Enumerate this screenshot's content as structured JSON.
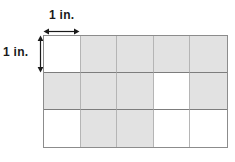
{
  "figure": {
    "width_label": "1 in.",
    "height_label": "1 in."
  },
  "colors": {
    "shaded_cell": "#e2e2e2",
    "unshaded_cell": "#ffffff",
    "column_line": "#b5b5b5",
    "row_line": "#7d7d7d",
    "outer_border": "#8c8c8c",
    "arrow": "#1a1a1a",
    "label_text": "#1a1a1a",
    "background": "#ffffff"
  },
  "chart_data": {
    "type": "heatmap",
    "columns": 5,
    "rows": 3,
    "unit_width": "1 in.",
    "unit_height": "1 in.",
    "total_cells": 15,
    "shaded_count": 9,
    "unshaded_count": 6,
    "legend": [
      "shaded",
      "unshaded"
    ],
    "grid": [
      [
        "unshaded",
        "shaded",
        "shaded",
        "shaded",
        "shaded"
      ],
      [
        "shaded",
        "shaded",
        "shaded",
        "unshaded",
        "shaded"
      ],
      [
        "unshaded",
        "shaded",
        "shaded",
        "unshaded",
        "unshaded"
      ]
    ],
    "values": [
      [
        0,
        1,
        1,
        1,
        1
      ],
      [
        1,
        1,
        1,
        0,
        1
      ],
      [
        0,
        1,
        1,
        0,
        0
      ]
    ]
  }
}
